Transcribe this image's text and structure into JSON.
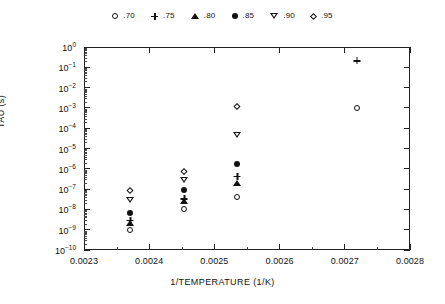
{
  "chart_data": {
    "type": "scatter",
    "title": "",
    "xlabel": "1/TEMPERATURE  (1/K)",
    "ylabel": "TAU (s)",
    "xlim": [
      0.0023,
      0.0028
    ],
    "ylim": [
      1e-10,
      1
    ],
    "yscale": "log",
    "xscale": "linear",
    "grid": false,
    "legend_position": "top",
    "xticks": [
      "0.0023",
      "0.0024",
      "0.0025",
      "0.0026",
      "0.0027",
      "0.0028"
    ],
    "xtick_values": [
      0.0023,
      0.0024,
      0.0025,
      0.0026,
      0.0027,
      0.0028
    ],
    "yticks": [
      "10^0",
      "10^-1",
      "10^-2",
      "10^-3",
      "10^-4",
      "10^-5",
      "10^-6",
      "10^-7",
      "10^-8",
      "10^-9",
      "10^-10"
    ],
    "ytick_exponents": [
      0,
      -1,
      -2,
      -3,
      -4,
      -5,
      -6,
      -7,
      -8,
      -9,
      -10
    ],
    "series": [
      {
        "name": ".70",
        "marker": "circle-open",
        "points": [
          {
            "x": 0.002371,
            "y": 1.2e-09
          },
          {
            "x": 0.002454,
            "y": 1.3e-08
          },
          {
            "x": 0.002535,
            "y": 5e-08
          },
          {
            "x": 0.002718,
            "y": 0.0013
          }
        ]
      },
      {
        "name": ".75",
        "marker": "plus",
        "points": [
          {
            "x": 0.002371,
            "y": 3.5e-09
          },
          {
            "x": 0.002454,
            "y": 4e-08
          },
          {
            "x": 0.002535,
            "y": 5e-07
          },
          {
            "x": 0.002718,
            "y": 0.25
          }
        ]
      },
      {
        "name": ".80",
        "marker": "triangle-up-filled",
        "points": [
          {
            "x": 0.002371,
            "y": 2.8e-09
          },
          {
            "x": 0.002454,
            "y": 3.2e-08
          },
          {
            "x": 0.002535,
            "y": 2.6e-07
          }
        ]
      },
      {
        "name": ".85",
        "marker": "circle-filled",
        "points": [
          {
            "x": 0.002371,
            "y": 8e-09
          },
          {
            "x": 0.002454,
            "y": 1.1e-07
          },
          {
            "x": 0.002535,
            "y": 2.2e-06
          }
        ]
      },
      {
        "name": ".90",
        "marker": "triangle-down-open",
        "points": [
          {
            "x": 0.002371,
            "y": 3.5e-08
          },
          {
            "x": 0.002454,
            "y": 3.5e-07
          },
          {
            "x": 0.002535,
            "y": 6e-05
          }
        ]
      },
      {
        "name": ".95",
        "marker": "diamond-open",
        "points": [
          {
            "x": 0.002371,
            "y": 1.1e-07
          },
          {
            "x": 0.002454,
            "y": 1e-06
          },
          {
            "x": 0.002535,
            "y": 0.0016
          }
        ]
      }
    ]
  },
  "legend": {
    "entries": [
      {
        "marker": "circle-open",
        "label": ".70"
      },
      {
        "marker": "plus",
        "label": ".75"
      },
      {
        "marker": "triangle-up-filled",
        "label": ".80"
      },
      {
        "marker": "circle-filled",
        "label": ".85"
      },
      {
        "marker": "triangle-down-open",
        "label": ".90"
      },
      {
        "marker": "diamond-open",
        "label": ".95"
      }
    ]
  },
  "colors": {
    "ink": "#111111",
    "frame": "#222222",
    "background": "#ffffff"
  }
}
